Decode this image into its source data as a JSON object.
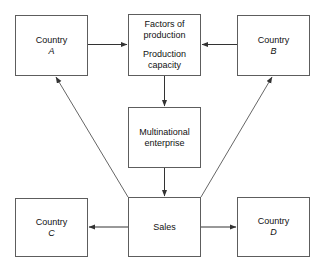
{
  "diagram": {
    "stroke_color": "#5d5d5d",
    "arrow_color": "#333333",
    "background_color": "#ffffff",
    "nodes": [
      {
        "id": "country-a",
        "lines": [
          "Country",
          "A"
        ],
        "italic_lines": [
          1
        ]
      },
      {
        "id": "factors",
        "groups": [
          [
            "Factors of",
            "production"
          ],
          [
            "Production",
            "capacity"
          ]
        ]
      },
      {
        "id": "country-b",
        "lines": [
          "Country",
          "B"
        ],
        "italic_lines": [
          1
        ]
      },
      {
        "id": "mne",
        "lines": [
          "Multinational",
          "enterprise"
        ],
        "italic_lines": []
      },
      {
        "id": "country-c",
        "lines": [
          "Country",
          "C"
        ],
        "italic_lines": [
          1
        ]
      },
      {
        "id": "sales",
        "lines": [
          "Sales"
        ],
        "italic_lines": []
      },
      {
        "id": "country-d",
        "lines": [
          "Country",
          "D"
        ],
        "italic_lines": [
          1
        ]
      }
    ],
    "labels": {
      "country_a_name": "Country",
      "country_a_letter": "A",
      "country_b_name": "Country",
      "country_b_letter": "B",
      "country_c_name": "Country",
      "country_c_letter": "C",
      "country_d_name": "Country",
      "country_d_letter": "D",
      "factors_line1": "Factors of",
      "factors_line2": "production",
      "factors_line3": "Production",
      "factors_line4": "capacity",
      "mne_line1": "Multinational",
      "mne_line2": "enterprise",
      "sales_line1": "Sales"
    },
    "edges": [
      {
        "id": "a-to-factors",
        "from": "country-a",
        "to": "factors",
        "style": "horizontal-right"
      },
      {
        "id": "b-to-factors",
        "from": "country-b",
        "to": "factors",
        "style": "horizontal-left"
      },
      {
        "id": "factors-to-mne",
        "from": "factors",
        "to": "mne",
        "style": "vertical-down"
      },
      {
        "id": "mne-to-sales",
        "from": "mne",
        "to": "sales",
        "style": "vertical-down"
      },
      {
        "id": "sales-to-country-c",
        "from": "sales",
        "to": "country-c",
        "style": "horizontal-left"
      },
      {
        "id": "sales-to-country-d",
        "from": "sales",
        "to": "country-d",
        "style": "horizontal-right"
      },
      {
        "id": "sales-to-country-a",
        "from": "sales",
        "to": "country-a",
        "style": "diagonal-up-left"
      },
      {
        "id": "sales-to-country-b",
        "from": "sales",
        "to": "country-b",
        "style": "diagonal-up-right"
      }
    ]
  }
}
